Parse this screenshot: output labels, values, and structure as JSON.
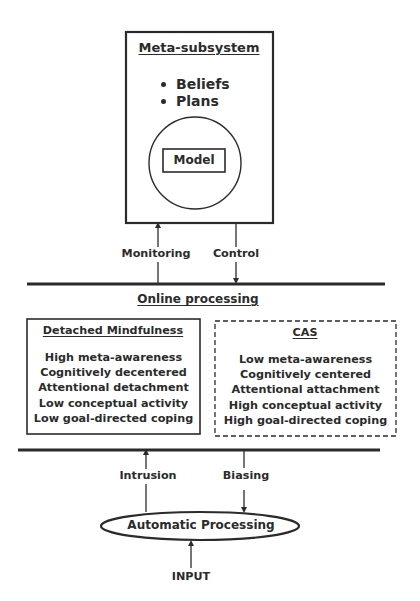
{
  "meta_subsystem": {
    "title": "Meta-subsystem",
    "bullets": [
      "Beliefs",
      "Plans"
    ],
    "model_label": "Model"
  },
  "upper_arrows": {
    "monitoring": "Monitoring",
    "control": "Control"
  },
  "online_processing": {
    "title": "Online processing",
    "detached_mindfulness": {
      "title": "Detached Mindfulness",
      "items": [
        "High meta-awareness",
        "Cognitively decentered",
        "Attentional detachment",
        "Low conceptual activity",
        "Low goal-directed coping"
      ]
    },
    "cas": {
      "title": "CAS",
      "items": [
        "Low meta-awareness",
        "Cognitively centered",
        "Attentional attachment",
        "High conceptual activity",
        "High goal-directed coping"
      ]
    }
  },
  "lower_arrows": {
    "intrusion": "Intrusion",
    "biasing": "Biasing"
  },
  "automatic_processing": {
    "label": "Automatic Processing"
  },
  "input": {
    "label": "INPUT"
  },
  "colors": {
    "stroke": "#2b2b2b",
    "background": "#ffffff"
  }
}
